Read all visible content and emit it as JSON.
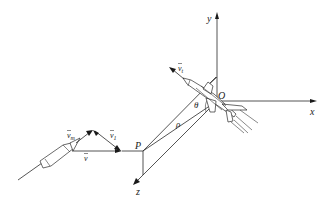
{
  "figure": {
    "axes": {
      "x_label": "x",
      "y_label": "y",
      "z_label": "z",
      "origin_label": "O"
    },
    "points": {
      "missile_point_label": "P"
    },
    "angles": {
      "theta_label": "θ",
      "rho_label": "ρ"
    },
    "vectors": {
      "target_velocity": {
        "symbol": "v",
        "subscript": "t"
      },
      "missile_velocity_m": {
        "symbol": "v",
        "subscript": "m"
      },
      "velocity_1": {
        "symbol": "v",
        "subscript": "1"
      },
      "velocity": {
        "symbol": "v",
        "subscript": ""
      }
    },
    "colors": {
      "line": "#2a2a2a",
      "background": "#ffffff"
    }
  }
}
